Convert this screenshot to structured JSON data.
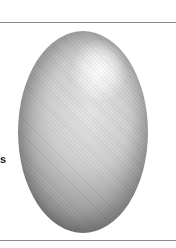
{
  "figure": {
    "cropped_label_fragment": "s",
    "colors": {
      "background": "#ffffff",
      "rule": "#8a8a8a",
      "egg_light": "#e6e6e6",
      "egg_dark": "#8c8c8c"
    }
  }
}
